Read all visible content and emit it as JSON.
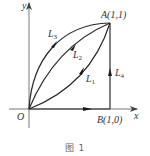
{
  "diagram": {
    "axes": {
      "x_label": "x",
      "y_label": "y",
      "origin_label": "O"
    },
    "points": {
      "A": {
        "label": "A(1,1)",
        "coords": [
          1,
          1
        ]
      },
      "B": {
        "label": "B(1,0)",
        "coords": [
          1,
          0
        ]
      }
    },
    "paths": [
      {
        "id": "L1",
        "name": "L",
        "sub": "1",
        "description": "lower convex curve from O to A"
      },
      {
        "id": "L2",
        "name": "L",
        "sub": "2",
        "description": "middle curve from O to A"
      },
      {
        "id": "L3",
        "name": "L",
        "sub": "3",
        "description": "upper concave curve from O to A"
      },
      {
        "id": "L4",
        "name": "L",
        "sub": "4",
        "description": "vertical segment from B to A"
      }
    ],
    "caption": "图 1",
    "colors": {
      "stroke": "#2a2a2a",
      "text": "#333333",
      "axis": "#555555"
    }
  }
}
